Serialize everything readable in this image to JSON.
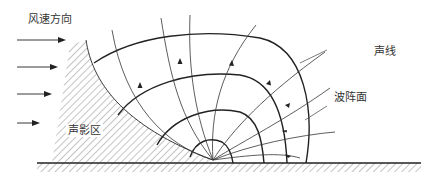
{
  "diagram": {
    "labels": {
      "wind_direction": "风速方向",
      "sound_ray": "声线",
      "wavefront": "波阵面",
      "shadow_zone": "声影区"
    },
    "colors": {
      "line": "#222222",
      "text": "#333333",
      "background": "#ffffff"
    },
    "elements": {
      "wind_arrows": 4,
      "wavefronts": 4,
      "sound_rays": 7
    }
  }
}
